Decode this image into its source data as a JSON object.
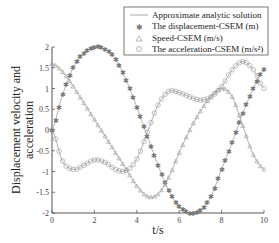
{
  "chart_data": {
    "type": "line",
    "title": "",
    "xlabel": "t/s",
    "ylabel_line1": "Displacement velocity and",
    "ylabel_line2": "acceleration",
    "xlim": [
      0,
      10
    ],
    "ylim": [
      -2,
      2
    ],
    "xticks": [
      "0",
      "2",
      "4",
      "6",
      "8",
      "10"
    ],
    "yticks": [
      "2",
      "1.5",
      "1",
      "0.5",
      "0",
      "-0.5",
      "-1",
      "-1.5",
      "-2"
    ],
    "grid": false,
    "legend_position": "top-right",
    "legend": [
      "Approximate analytic solution",
      "The displacement-CSEM (m)",
      "Speed-CSEM (m/s)",
      "The acceleration-CSEM (m/s²)"
    ],
    "x": [
      0,
      0.5,
      1,
      1.5,
      2,
      2.5,
      3,
      3.5,
      4,
      4.5,
      5,
      5.5,
      6,
      6.5,
      7,
      7.5,
      8,
      8.5,
      9,
      9.5,
      10
    ],
    "series": [
      {
        "name": "The displacement-CSEM (m)",
        "marker": "star",
        "values": [
          0,
          0.85,
          1.5,
          1.85,
          2.0,
          1.95,
          1.7,
          1.2,
          0.55,
          -0.15,
          -0.85,
          -1.45,
          -1.85,
          -2.0,
          -1.95,
          -1.6,
          -0.95,
          -0.3,
          0.4,
          1.0,
          1.45
        ]
      },
      {
        "name": "Speed-CSEM (m/s)",
        "marker": "triangle",
        "values": [
          1.6,
          1.4,
          1.05,
          0.65,
          0.25,
          -0.15,
          -0.55,
          -0.95,
          -1.35,
          -1.6,
          -1.55,
          -1.15,
          -0.55,
          0.0,
          0.45,
          0.8,
          1.0,
          0.8,
          0.1,
          -0.6,
          -0.95
        ]
      },
      {
        "name": "The acceleration-CSEM (m/s²)",
        "marker": "circle",
        "values": [
          0,
          -0.75,
          -0.95,
          -0.85,
          -0.72,
          -0.78,
          -0.95,
          -0.98,
          -0.7,
          -0.05,
          0.6,
          0.93,
          0.9,
          0.8,
          0.72,
          0.8,
          1.05,
          1.45,
          1.65,
          1.45,
          1.0
        ]
      }
    ]
  }
}
